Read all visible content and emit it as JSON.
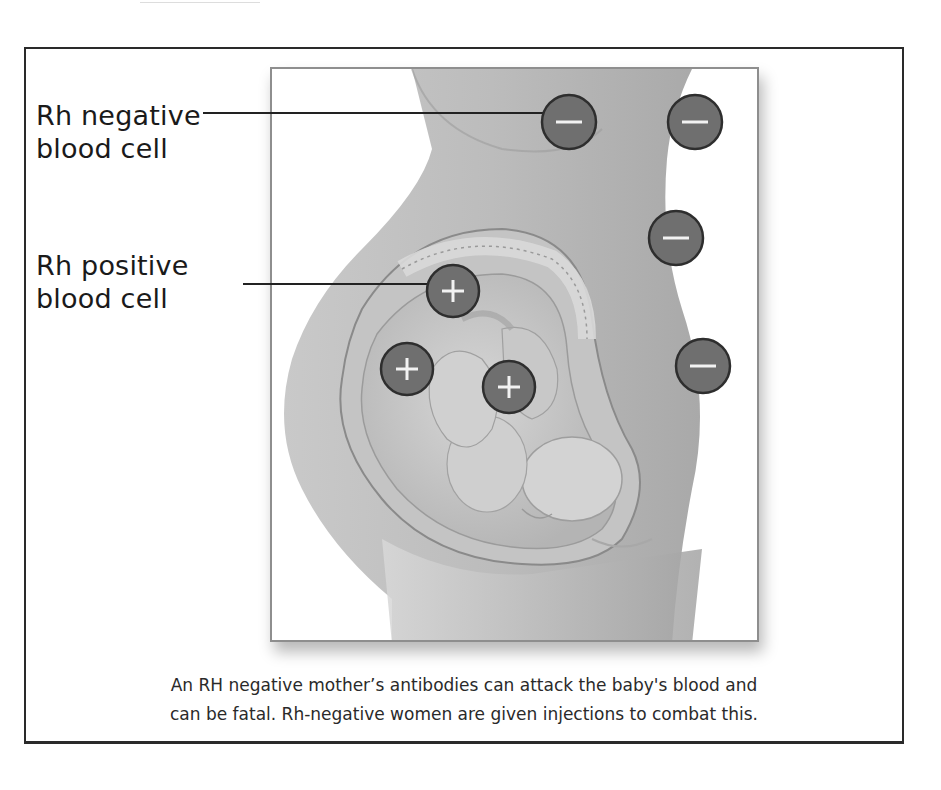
{
  "figure": {
    "labels": {
      "rh_negative": {
        "line1": "Rh negative",
        "line2": "blood cell"
      },
      "rh_positive": {
        "line1": "Rh positive",
        "line2": "blood cell"
      }
    },
    "caption": {
      "line1": "An RH negative mother’s antibodies can attack the baby's blood and",
      "line2": "can be fatal. Rh-negative women are given injections to combat this."
    },
    "cells": {
      "negative": [
        {
          "symbol": "−",
          "x": 569,
          "y": 122
        },
        {
          "symbol": "−",
          "x": 695,
          "y": 122
        },
        {
          "symbol": "−",
          "x": 676,
          "y": 237
        },
        {
          "symbol": "−",
          "x": 702,
          "y": 367
        }
      ],
      "positive": [
        {
          "symbol": "+",
          "x": 452,
          "y": 292
        },
        {
          "symbol": "+",
          "x": 407,
          "y": 367
        },
        {
          "symbol": "+",
          "x": 509,
          "y": 387
        }
      ]
    },
    "colors": {
      "cell_fill": "#6f6f6f",
      "cell_stroke": "#2e2e2e",
      "body_shade": "#b9b9b9",
      "frame_border": "#2a2a2a"
    }
  }
}
